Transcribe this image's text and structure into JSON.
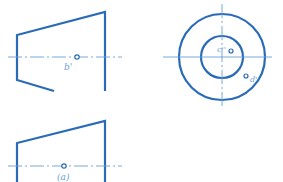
{
  "figure": {
    "colors": {
      "outline": "#2a6bb8",
      "centerline": "#6a9fd6",
      "background": "#ffffff"
    },
    "front_view": {
      "point_label": "b'",
      "shape": "truncated-cone-section"
    },
    "side_view": {
      "labels": {
        "c": "c''",
        "d": "d''"
      },
      "shape": "concentric-circles"
    },
    "top_view": {
      "point_label": "(a)",
      "shape": "truncated-cone-partial"
    }
  }
}
